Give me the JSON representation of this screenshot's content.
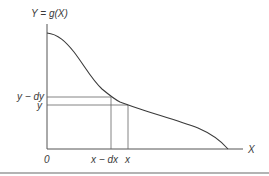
{
  "figure": {
    "y_axis_label": "Y = g(X)",
    "x_axis_label": "X",
    "origin_label": "0",
    "y_ticks": [
      {
        "label": "y − dy",
        "pixel_y": 97
      },
      {
        "label": "y",
        "pixel_y": 105
      }
    ],
    "x_ticks": [
      {
        "label": "x − dx",
        "pixel_x": 111
      },
      {
        "label": "x",
        "pixel_x": 128
      }
    ],
    "curve": {
      "description": "monotonically decreasing function g(X) starting on the Y-axis and reaching the X-axis",
      "start": [
        47,
        33
      ],
      "end": [
        228,
        149
      ]
    },
    "colors": {
      "line": "#3a3a3a",
      "axis": "#555555",
      "rule": "#9a9a9a",
      "background": "#ffffff"
    }
  }
}
